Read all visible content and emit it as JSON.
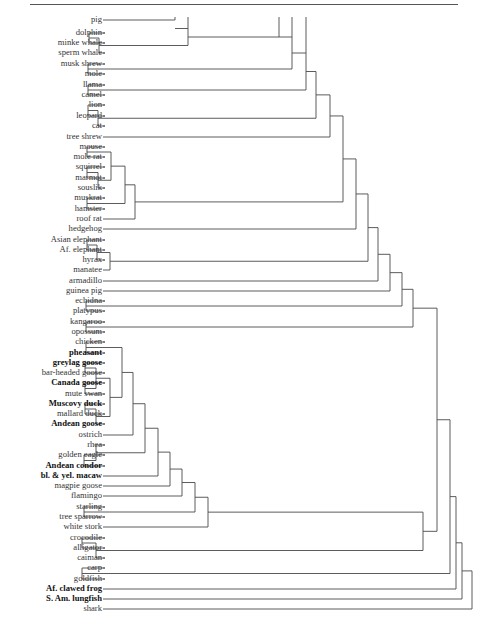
{
  "chart_data": {
    "type": "dendrogram",
    "title": "",
    "orientation": "leaves-left, root-right",
    "leaves": [
      {
        "id": "pig",
        "label": "pig",
        "y": 20
      },
      {
        "id": "dolphin",
        "label": "dolphin",
        "y": 33
      },
      {
        "id": "minke",
        "label": "minke whale",
        "y": 43
      },
      {
        "id": "sperm",
        "label": "sperm whale",
        "y": 53
      },
      {
        "id": "muskshrew",
        "label": "musk shrew",
        "y": 64
      },
      {
        "id": "mole",
        "label": "mole",
        "y": 74
      },
      {
        "id": "llama",
        "label": "llama",
        "y": 85
      },
      {
        "id": "camel",
        "label": "camel",
        "y": 95
      },
      {
        "id": "lion",
        "label": "lion",
        "y": 105
      },
      {
        "id": "leopard",
        "label": "leopard",
        "y": 116
      },
      {
        "id": "cat",
        "label": "cat",
        "y": 126
      },
      {
        "id": "treeshrew",
        "label": "tree shrew",
        "y": 137
      },
      {
        "id": "mouse",
        "label": "mouse",
        "y": 147
      },
      {
        "id": "molerat",
        "label": "mole rat",
        "y": 157
      },
      {
        "id": "squirrel",
        "label": "squirrel",
        "y": 167
      },
      {
        "id": "marmot",
        "label": "marmot",
        "y": 178
      },
      {
        "id": "souslik",
        "label": "souslik",
        "y": 188
      },
      {
        "id": "muskrat",
        "label": "muskrat",
        "y": 198
      },
      {
        "id": "hamster",
        "label": "hamster",
        "y": 209
      },
      {
        "id": "roofrat",
        "label": "roof rat",
        "y": 219
      },
      {
        "id": "hedgehog",
        "label": "hedgehog",
        "y": 229
      },
      {
        "id": "asianeleph",
        "label": "Asian elephant",
        "y": 240
      },
      {
        "id": "afeleph",
        "label": "Af. elephant",
        "y": 250
      },
      {
        "id": "hyrax",
        "label": "hyrax",
        "y": 260
      },
      {
        "id": "manatee",
        "label": "manatee",
        "y": 270
      },
      {
        "id": "armadillo",
        "label": "armadillo",
        "y": 281
      },
      {
        "id": "guineapig",
        "label": "guinea pig",
        "y": 291
      },
      {
        "id": "echidna",
        "label": "echidna",
        "y": 301
      },
      {
        "id": "platypus",
        "label": "platypus",
        "y": 311
      },
      {
        "id": "kangaroo",
        "label": "kangaroo",
        "y": 322
      },
      {
        "id": "opossum",
        "label": "opossum",
        "y": 332
      },
      {
        "id": "chicken",
        "label": "chicken",
        "y": 342
      },
      {
        "id": "pheasant",
        "label": "pheasant",
        "y": 353,
        "bold": true
      },
      {
        "id": "greylag",
        "label": "greylag goose",
        "y": 363,
        "bold": true
      },
      {
        "id": "barheaded",
        "label": "bar-headed goose",
        "y": 373
      },
      {
        "id": "canada",
        "label": "Canada goose",
        "y": 383,
        "bold": true
      },
      {
        "id": "muteswan",
        "label": "mute swan",
        "y": 394
      },
      {
        "id": "muscovy",
        "label": "Muscovy duck",
        "y": 404,
        "bold": true
      },
      {
        "id": "mallard",
        "label": "mallard duck",
        "y": 414
      },
      {
        "id": "andeangoose",
        "label": "Andean goose",
        "y": 424,
        "bold": true
      },
      {
        "id": "ostrich",
        "label": "ostrich",
        "y": 435
      },
      {
        "id": "rhea",
        "label": "rhea",
        "y": 445
      },
      {
        "id": "goldeneagle",
        "label": "golden eagle",
        "y": 455
      },
      {
        "id": "andeancondor",
        "label": "Andean condor",
        "y": 466,
        "bold": true
      },
      {
        "id": "macaw",
        "label": "bl. & yel. macaw",
        "y": 476,
        "bold": true
      },
      {
        "id": "magpiegoose",
        "label": "magpie goose",
        "y": 486
      },
      {
        "id": "flamingo",
        "label": "flamingo",
        "y": 496
      },
      {
        "id": "starling",
        "label": "starling",
        "y": 507
      },
      {
        "id": "treesparrow",
        "label": "tree sparrow",
        "y": 517
      },
      {
        "id": "whitestork",
        "label": "white stork",
        "y": 527
      },
      {
        "id": "crocodile",
        "label": "crocodile",
        "y": 538
      },
      {
        "id": "alligator",
        "label": "alligator",
        "y": 548
      },
      {
        "id": "caiman",
        "label": "caiman",
        "y": 558
      },
      {
        "id": "carp",
        "label": "carp",
        "y": 568
      },
      {
        "id": "goldfish",
        "label": "goldfish",
        "y": 579
      },
      {
        "id": "afclawedfrog",
        "label": "Af. clawed frog",
        "y": 589,
        "bold": true
      },
      {
        "id": "samlungfish",
        "label": "S. Am. lungfish",
        "y": 599,
        "bold": true
      },
      {
        "id": "shark",
        "label": "shark",
        "y": 609
      }
    ],
    "label_right_x": 102,
    "line_start_x": 105,
    "nodes": [
      {
        "id": "n_dol_minke",
        "x": 89,
        "children": [
          "dolphin",
          "minke"
        ]
      },
      {
        "id": "n_whales",
        "x": 99,
        "children": [
          "n_dol_minke",
          "sperm"
        ]
      },
      {
        "id": "n_pigtop",
        "x": 175,
        "children": [
          "pig"
        ],
        "open_top": true
      },
      {
        "id": "n_cetart",
        "x": 188,
        "children": [
          "n_pigtop",
          "n_whales"
        ],
        "open_top": true
      },
      {
        "id": "n_cetart2",
        "x": 279,
        "children": [
          "n_cetart"
        ],
        "open_top": true
      },
      {
        "id": "n_shrewmole",
        "x": 88,
        "children": [
          "muskshrew",
          "mole"
        ]
      },
      {
        "id": "n_g1",
        "x": 292,
        "children": [
          "n_cetart2",
          "n_shrewmole"
        ],
        "open_top": true
      },
      {
        "id": "n_camelid",
        "x": 88,
        "children": [
          "llama",
          "camel"
        ]
      },
      {
        "id": "n_g2",
        "x": 306,
        "children": [
          "n_g1",
          "n_camelid"
        ],
        "open_top": true
      },
      {
        "id": "n_lionleo",
        "x": 88,
        "children": [
          "lion",
          "leopard"
        ]
      },
      {
        "id": "n_cats",
        "x": 98,
        "children": [
          "n_lionleo",
          "cat"
        ]
      },
      {
        "id": "n_g3",
        "x": 316,
        "children": [
          "n_g2",
          "n_cats"
        ]
      },
      {
        "id": "n_g4",
        "x": 330,
        "children": [
          "n_g3",
          "treeshrew"
        ]
      },
      {
        "id": "n_mousemr",
        "x": 87,
        "children": [
          "mouse",
          "molerat"
        ]
      },
      {
        "id": "n_sqmar",
        "x": 87,
        "children": [
          "squirrel",
          "marmot"
        ]
      },
      {
        "id": "n_squirrels",
        "x": 98,
        "children": [
          "n_sqmar",
          "souslik"
        ]
      },
      {
        "id": "n_mice_sq",
        "x": 111,
        "children": [
          "n_mousemr",
          "n_squirrels"
        ]
      },
      {
        "id": "n_mushams",
        "x": 87,
        "children": [
          "muskrat",
          "hamster"
        ]
      },
      {
        "id": "n_rod1",
        "x": 125,
        "children": [
          "n_mice_sq",
          "n_mushams"
        ]
      },
      {
        "id": "n_rodents",
        "x": 135,
        "children": [
          "n_rod1",
          "roofrat"
        ]
      },
      {
        "id": "n_g5",
        "x": 343,
        "children": [
          "n_g4",
          "n_rodents"
        ]
      },
      {
        "id": "n_g6",
        "x": 356,
        "children": [
          "n_g5",
          "hedgehog"
        ]
      },
      {
        "id": "n_elephs",
        "x": 87,
        "children": [
          "asianeleph",
          "afeleph"
        ]
      },
      {
        "id": "n_ele_hyr",
        "x": 97,
        "children": [
          "n_elephs",
          "hyrax"
        ]
      },
      {
        "id": "n_paen",
        "x": 110,
        "children": [
          "n_ele_hyr",
          "manatee"
        ]
      },
      {
        "id": "n_g7",
        "x": 368,
        "children": [
          "n_g6",
          "n_paen"
        ]
      },
      {
        "id": "n_g8",
        "x": 378,
        "children": [
          "n_g7",
          "armadillo"
        ]
      },
      {
        "id": "n_g9",
        "x": 390,
        "children": [
          "n_g8",
          "guineapig"
        ]
      },
      {
        "id": "n_mono",
        "x": 86,
        "children": [
          "echidna",
          "platypus"
        ]
      },
      {
        "id": "n_g10",
        "x": 402,
        "children": [
          "n_g9",
          "n_mono"
        ]
      },
      {
        "id": "n_mars",
        "x": 86,
        "children": [
          "kangaroo",
          "opossum"
        ]
      },
      {
        "id": "n_mammals",
        "x": 413,
        "children": [
          "n_g10",
          "n_mars"
        ]
      },
      {
        "id": "n_galli",
        "x": 86,
        "children": [
          "chicken",
          "pheasant"
        ]
      },
      {
        "id": "n_geese1",
        "x": 85,
        "children": [
          "greylag",
          "barheaded"
        ]
      },
      {
        "id": "n_geese2",
        "x": 85,
        "children": [
          "canada",
          "muteswan"
        ]
      },
      {
        "id": "n_geese",
        "x": 96,
        "children": [
          "n_geese1",
          "n_geese2"
        ]
      },
      {
        "id": "n_ducks1",
        "x": 85,
        "children": [
          "muscovy",
          "mallard"
        ]
      },
      {
        "id": "n_ducks",
        "x": 96,
        "children": [
          "n_ducks1",
          "andeangoose"
        ]
      },
      {
        "id": "n_anat",
        "x": 110,
        "children": [
          "n_geese",
          "n_ducks"
        ]
      },
      {
        "id": "n_galloans",
        "x": 122,
        "children": [
          "n_galli",
          "n_anat"
        ]
      },
      {
        "id": "n_b1",
        "x": 133,
        "children": [
          "n_galloans",
          "ostrich"
        ]
      },
      {
        "id": "n_eaglecondor",
        "x": 84,
        "children": [
          "goldeneagle",
          "andeancondor"
        ]
      },
      {
        "id": "n_raptor",
        "x": 96,
        "children": [
          "rhea",
          "n_eaglecondor"
        ]
      },
      {
        "id": "n_b2",
        "x": 145,
        "children": [
          "n_b1",
          "n_raptor"
        ]
      },
      {
        "id": "n_b3",
        "x": 158,
        "children": [
          "n_b2",
          "macaw"
        ]
      },
      {
        "id": "n_b4",
        "x": 170,
        "children": [
          "n_b3",
          "magpiegoose"
        ]
      },
      {
        "id": "n_b5",
        "x": 182,
        "children": [
          "n_b4",
          "flamingo"
        ]
      },
      {
        "id": "n_passer",
        "x": 84,
        "children": [
          "starling",
          "treesparrow"
        ]
      },
      {
        "id": "n_b6",
        "x": 195,
        "children": [
          "n_b5",
          "n_passer"
        ]
      },
      {
        "id": "n_birds",
        "x": 208,
        "children": [
          "n_b6",
          "whitestork"
        ]
      },
      {
        "id": "n_croc",
        "x": 82,
        "children": [
          "crocodile",
          "alligator"
        ]
      },
      {
        "id": "n_crocs",
        "x": 96,
        "children": [
          "n_croc",
          "caiman"
        ]
      },
      {
        "id": "n_archo",
        "x": 423,
        "children": [
          "n_birds",
          "n_crocs"
        ]
      },
      {
        "id": "n_amniota",
        "x": 437,
        "children": [
          "n_mammals",
          "n_archo"
        ]
      },
      {
        "id": "n_fish",
        "x": 82,
        "children": [
          "carp",
          "goldfish"
        ]
      },
      {
        "id": "n_t1",
        "x": 450,
        "children": [
          "n_amniota",
          "n_fish"
        ]
      },
      {
        "id": "n_t2",
        "x": 456,
        "children": [
          "n_t1",
          "afclawedfrog"
        ]
      },
      {
        "id": "n_t3",
        "x": 462,
        "children": [
          "n_t2",
          "samlungfish"
        ]
      },
      {
        "id": "n_root",
        "x": 472,
        "children": [
          "n_t3",
          "shark"
        ]
      }
    ],
    "top_continuations": [
      {
        "x": 175,
        "y_top": 17,
        "y_bottom": 20
      },
      {
        "x": 188,
        "y_top": 17,
        "y_bottom": 42
      },
      {
        "x": 278,
        "y_top": 17,
        "y_bottom": 40
      },
      {
        "x": 292,
        "y_top": 17,
        "y_bottom": 79
      },
      {
        "x": 306,
        "y_top": 17,
        "y_bottom": 60
      }
    ],
    "line_color": "#4a4a4a"
  }
}
